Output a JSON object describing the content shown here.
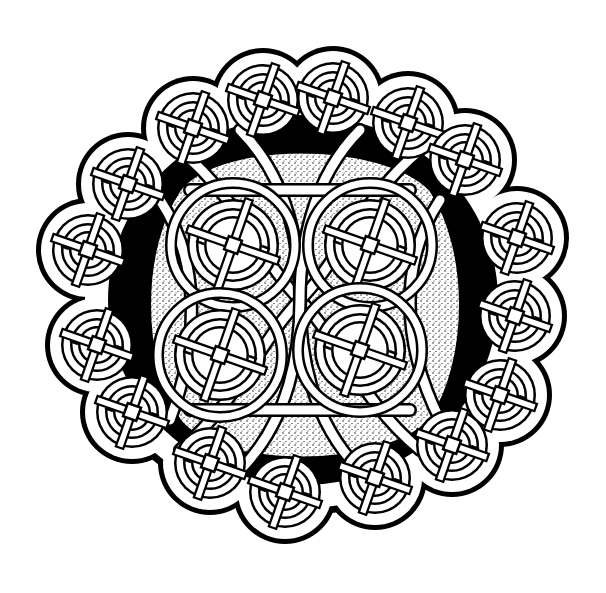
{
  "image": {
    "subject": "Celtic knotwork roundel",
    "style": "black ink line art on white with stippled interior background",
    "colors": {
      "background": "#ffffff",
      "ink": "#000000",
      "band_fill": "#ffffff",
      "stipple": "#000000"
    },
    "outer_ring": {
      "knot_count": 16,
      "knot_type": "circular interlace knot"
    },
    "inner_field": {
      "knot_count": 4,
      "arrangement": "2x2 grid of circular knots",
      "background": "stippled"
    }
  }
}
